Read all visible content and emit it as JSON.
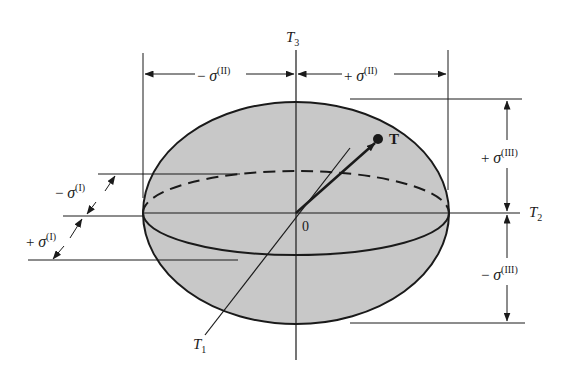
{
  "figure": {
    "type": "stress ellipsoid diagram",
    "colors": {
      "fill": "#c8c8c8",
      "stroke": "#1a1a1a",
      "background": "#ffffff"
    }
  },
  "axes": {
    "t1": {
      "symbol": "T",
      "subscript": "1"
    },
    "t2": {
      "symbol": "T",
      "subscript": "2"
    },
    "t3": {
      "symbol": "T",
      "subscript": "3"
    },
    "origin": "0"
  },
  "vector": {
    "label": "T"
  },
  "dimensions": {
    "sigma_II_neg": {
      "sign": "−",
      "symbol": "σ",
      "sup": "(II)"
    },
    "sigma_II_pos": {
      "sign": "+",
      "symbol": "σ",
      "sup": "(II)"
    },
    "sigma_I_neg": {
      "sign": "−",
      "symbol": "σ",
      "sup": "(I)"
    },
    "sigma_I_pos": {
      "sign": "+",
      "symbol": "σ",
      "sup": "(I)"
    },
    "sigma_III_pos": {
      "sign": "+",
      "symbol": "σ",
      "sup": "(III)"
    },
    "sigma_III_neg": {
      "sign": "−",
      "symbol": "σ",
      "sup": "(III)"
    }
  }
}
